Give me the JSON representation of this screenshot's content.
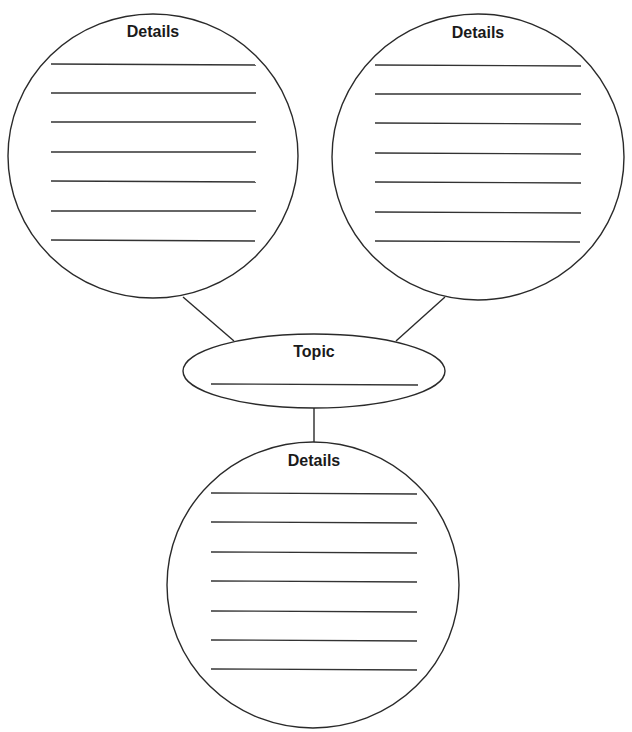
{
  "diagram": {
    "type": "graphic-organizer",
    "colors": {
      "stroke": "#2a2a2a",
      "background": "#ffffff",
      "text": "#1a1a1a"
    },
    "topic": {
      "label": "Topic",
      "writing_lines": 1
    },
    "detail_circles": [
      {
        "position": "top-left",
        "label": "Details",
        "writing_lines": 7
      },
      {
        "position": "top-right",
        "label": "Details",
        "writing_lines": 7
      },
      {
        "position": "bottom",
        "label": "Details",
        "writing_lines": 7
      }
    ]
  }
}
